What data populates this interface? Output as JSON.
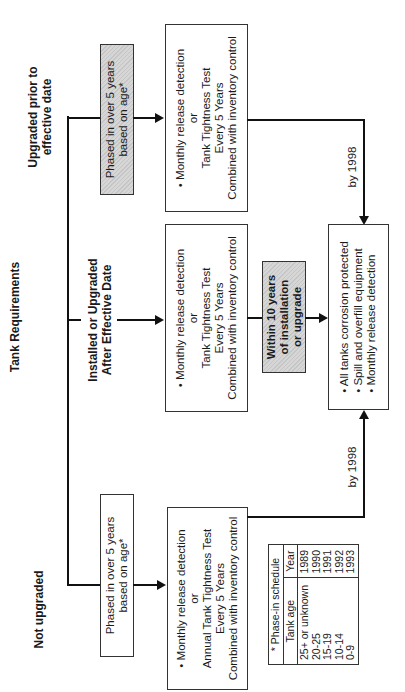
{
  "title": "Tank Requirements",
  "branches": {
    "upgraded_prior": {
      "label_line1": "Upgraded prior to",
      "label_line2": "effective date",
      "phase_box": {
        "line1": "Phased in over 5 years",
        "line2": "based on age*"
      },
      "requirement_box": {
        "line1": "• Monthly release detection",
        "line2": "or",
        "line3": "Tank Tightness Test",
        "line4": "Every 5 Years",
        "line5": "Combined with inventory control"
      },
      "deadline_label": "by 1998"
    },
    "installed_after": {
      "label_line1": "Installed or Upgraded",
      "label_line2": "After Effective Date",
      "requirement_box": {
        "line1": "• Monthly release detection",
        "line2": "or",
        "line3": "Tank Tightness Test",
        "line4": "Every 5 Years",
        "line5": "Combined with inventory control"
      },
      "deadline_box": {
        "line1": "Within 10 years",
        "line2": "of installation",
        "line3": "or upgrade"
      }
    },
    "not_upgraded": {
      "label": "Not upgraded",
      "phase_box": {
        "line1": "Phased in over 5 years",
        "line2": "based on age*"
      },
      "requirement_box": {
        "line1": "• Monthly release detection",
        "line2": "or",
        "line3": "Annual Tank Tightness Test",
        "line4": "Every 5 Years",
        "line5": "Combined with inventory control"
      },
      "deadline_label": "by 1998"
    }
  },
  "final_box": {
    "items": [
      "• All tanks corrosion protected",
      "• Spill and overfill equipment",
      "• Monthly release detection"
    ]
  },
  "phase_in_schedule": {
    "title": "* Phase-in schedule",
    "headers": [
      "Tank age",
      "Year"
    ],
    "rows": [
      [
        "25+ or unknown",
        "1989"
      ],
      [
        "20-25",
        "1990"
      ],
      [
        "15-19",
        "1991"
      ],
      [
        "10-14",
        "1992"
      ],
      [
        "0-9",
        "1993"
      ]
    ]
  }
}
